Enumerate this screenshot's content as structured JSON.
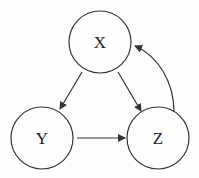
{
  "diagram": {
    "nodes": [
      {
        "id": "X",
        "label": "X",
        "cx": 100,
        "cy": 42,
        "r": 31
      },
      {
        "id": "Y",
        "label": "Y",
        "cx": 42,
        "cy": 138,
        "r": 31
      },
      {
        "id": "Z",
        "label": "Z",
        "cx": 158,
        "cy": 138,
        "r": 31
      }
    ],
    "edges": [
      {
        "from": "X",
        "to": "Y"
      },
      {
        "from": "X",
        "to": "Z"
      },
      {
        "from": "Y",
        "to": "Z"
      },
      {
        "from": "Z",
        "to": "X",
        "curved": true
      }
    ],
    "colors": {
      "stroke": "#333333",
      "background": "#fdfdfd"
    }
  }
}
